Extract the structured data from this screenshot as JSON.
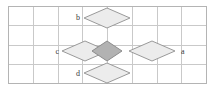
{
  "figure": {
    "type": "lattice-diagram",
    "width": 214,
    "height": 89,
    "background_color": "#ffffff",
    "grid": {
      "frame": {
        "x": 8,
        "y": 6,
        "width": 198,
        "height": 77
      },
      "frame_color": "#b4b4b4",
      "line_color": "#c9c9c9",
      "columns": 8,
      "rows": 4,
      "cell_width": 24.75,
      "cell_height": 19.25,
      "vertical_line_x": [
        32.75,
        57.5,
        82.25,
        107,
        131.75,
        156.5,
        181.25
      ],
      "horizontal_line_y": [
        25.25,
        44.5,
        63.75
      ]
    },
    "diamonds": [
      {
        "id": "center",
        "label": "",
        "fill": "#b2b2b2",
        "stroke": "#8c8c8c",
        "center_x": 107,
        "center_y": 51,
        "half_width": 15,
        "half_height": 10
      },
      {
        "id": "top",
        "label": "b",
        "fill": "#ececec",
        "stroke": "#9a9a9a",
        "center_x": 107,
        "center_y": 18,
        "half_width": 23,
        "half_height": 10
      },
      {
        "id": "left",
        "label": "c",
        "fill": "#ececec",
        "stroke": "#9a9a9a",
        "center_x": 85,
        "center_y": 51,
        "half_width": 23,
        "half_height": 10
      },
      {
        "id": "right",
        "label": "a",
        "fill": "#ececec",
        "stroke": "#9a9a9a",
        "center_x": 152,
        "center_y": 51,
        "half_width": 23,
        "half_height": 10
      },
      {
        "id": "bottom",
        "label": "d",
        "fill": "#ececec",
        "stroke": "#9a9a9a",
        "center_x": 107,
        "center_y": 73,
        "half_width": 23,
        "half_height": 10
      }
    ],
    "labels": [
      {
        "id": "label-b",
        "text": "b",
        "x": 80,
        "y": 20,
        "anchor": "end"
      },
      {
        "id": "label-c",
        "text": "c",
        "x": 59,
        "y": 54,
        "anchor": "end"
      },
      {
        "id": "label-a",
        "text": "a",
        "x": 181,
        "y": 54,
        "anchor": "start"
      },
      {
        "id": "label-d",
        "text": "d",
        "x": 80,
        "y": 76,
        "anchor": "end"
      }
    ]
  }
}
